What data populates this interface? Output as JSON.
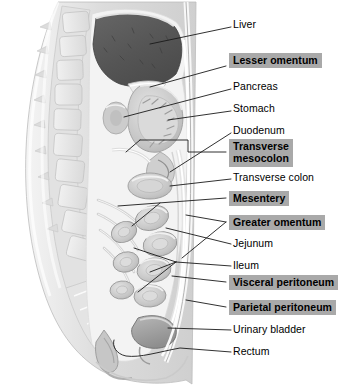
{
  "figure": {
    "orientation": "sagittal",
    "background_color": "#ffffff"
  },
  "style": {
    "highlight_bg": "#a9a9a9",
    "text_color": "#000000",
    "leader_color": "#1a1a1a",
    "liver_fill": "#5a5a5a",
    "body_fill": "#d8d8d8",
    "organ_fill": "#c2c2c2",
    "bone_fill": "#e6e6e6",
    "peritoneum_fill": "#f2f2f2"
  },
  "labels": [
    {
      "id": "liver",
      "text": "Liver",
      "highlighted": false,
      "x": 233,
      "y": 25,
      "lines": [
        "Liver"
      ]
    },
    {
      "id": "lesser-omentum",
      "text": "Lesser omentum",
      "highlighted": true,
      "x": 229,
      "y": 60,
      "lines": [
        "Lesser omentum"
      ]
    },
    {
      "id": "pancreas",
      "text": "Pancreas",
      "highlighted": false,
      "x": 233,
      "y": 86,
      "lines": [
        "Pancreas"
      ]
    },
    {
      "id": "stomach",
      "text": "Stomach",
      "highlighted": false,
      "x": 233,
      "y": 108,
      "lines": [
        "Stomach"
      ]
    },
    {
      "id": "duodenum",
      "text": "Duodenum",
      "highlighted": false,
      "x": 233,
      "y": 130,
      "lines": [
        "Duodenum"
      ]
    },
    {
      "id": "transverse-mesocolon",
      "text": "Transverse mesocolon",
      "highlighted": true,
      "x": 229,
      "y": 143,
      "lines": [
        "Transverse",
        "mesocolon"
      ]
    },
    {
      "id": "transverse-colon",
      "text": "Transverse colon",
      "highlighted": false,
      "x": 233,
      "y": 176,
      "lines": [
        "Transverse colon"
      ]
    },
    {
      "id": "mesentery",
      "text": "Mesentery",
      "highlighted": true,
      "x": 229,
      "y": 193,
      "lines": [
        "Mesentery"
      ]
    },
    {
      "id": "greater-omentum",
      "text": "Greater omentum",
      "highlighted": true,
      "x": 229,
      "y": 215,
      "lines": [
        "Greater omentum"
      ]
    },
    {
      "id": "jejunum",
      "text": "Jejunum",
      "highlighted": false,
      "x": 233,
      "y": 241,
      "lines": [
        "Jejunum"
      ]
    },
    {
      "id": "ileum",
      "text": "Ileum",
      "highlighted": false,
      "x": 233,
      "y": 263,
      "lines": [
        "Ileum"
      ]
    },
    {
      "id": "visceral-peritoneum",
      "text": "Visceral peritoneum",
      "highlighted": true,
      "x": 229,
      "y": 276,
      "lines": [
        "Visceral peritoneum"
      ]
    },
    {
      "id": "parietal-peritoneum",
      "text": "Parietal peritoneum",
      "highlighted": true,
      "x": 229,
      "y": 301,
      "lines": [
        "Parietal peritoneum"
      ]
    },
    {
      "id": "urinary-bladder",
      "text": "Urinary bladder",
      "highlighted": false,
      "x": 233,
      "y": 327,
      "lines": [
        "Urinary bladder"
      ]
    },
    {
      "id": "rectum",
      "text": "Rectum",
      "highlighted": false,
      "x": 233,
      "y": 349,
      "lines": [
        "Rectum"
      ]
    }
  ],
  "structures": [
    {
      "id": "vertebral-column",
      "name": "Vertebral column"
    },
    {
      "id": "liver",
      "name": "Liver"
    },
    {
      "id": "stomach",
      "name": "Stomach"
    },
    {
      "id": "pancreas",
      "name": "Pancreas"
    },
    {
      "id": "duodenum",
      "name": "Duodenum"
    },
    {
      "id": "transverse-colon",
      "name": "Transverse colon"
    },
    {
      "id": "small-intestine-loops",
      "name": "Small intestine loops"
    },
    {
      "id": "greater-omentum-apron",
      "name": "Greater omentum apron"
    },
    {
      "id": "urinary-bladder",
      "name": "Urinary bladder"
    },
    {
      "id": "rectum",
      "name": "Rectum"
    },
    {
      "id": "sacrum",
      "name": "Sacrum"
    },
    {
      "id": "abdominal-wall",
      "name": "Abdominal wall"
    }
  ]
}
